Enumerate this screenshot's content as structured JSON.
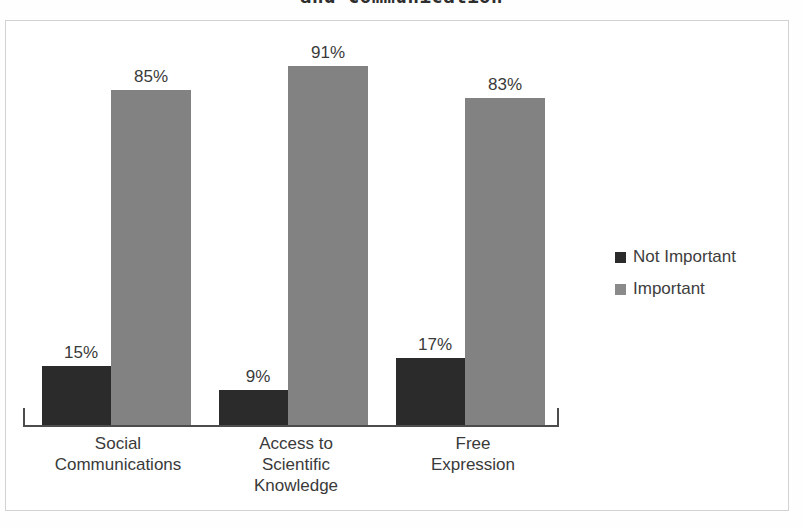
{
  "chart_data": {
    "type": "bar",
    "title": "and Communication",
    "title_note": "Title is clipped at the top edge of the screenshot; only the second line is visible.",
    "xlabel": "",
    "ylabel": "",
    "ylim": [
      0,
      100
    ],
    "grid": false,
    "legend_position": "right",
    "orientation": "vertical",
    "grouping": "clustered",
    "categories": [
      "Social Communications",
      "Access to Scientific Knowledge",
      "Free Expression"
    ],
    "category_lines": [
      [
        "Social",
        "Communications"
      ],
      [
        "Access to",
        "Scientific",
        "Knowledge"
      ],
      [
        "Free",
        "Expression"
      ]
    ],
    "series": [
      {
        "name": "Not Important",
        "color": "#2b2b2b",
        "values": [
          15,
          9,
          17
        ],
        "labels": [
          "15%",
          "9%",
          "17%"
        ]
      },
      {
        "name": "Important",
        "color": "#828282",
        "values": [
          85,
          91,
          83
        ],
        "labels": [
          "85%",
          "91%",
          "83%"
        ]
      }
    ],
    "axis": {
      "has_left_tick": true,
      "has_right_tick": true,
      "baseline_color": "#4c4c4c",
      "tick_labels": []
    }
  },
  "legend": {
    "items": [
      {
        "label": "Not Important",
        "swatch": "dark-square-icon"
      },
      {
        "label": "Important",
        "swatch": "gray-square-icon"
      }
    ]
  },
  "bars": [
    {
      "group": 0,
      "series": 0,
      "label": "15%",
      "value": 15,
      "left": 19,
      "width": 78,
      "tone": "dark"
    },
    {
      "group": 0,
      "series": 1,
      "label": "85%",
      "value": 85,
      "left": 88,
      "width": 80,
      "tone": "light"
    },
    {
      "group": 1,
      "series": 0,
      "label": "9%",
      "value": 9,
      "left": 196,
      "width": 78,
      "tone": "dark"
    },
    {
      "group": 1,
      "series": 1,
      "label": "91%",
      "value": 91,
      "left": 265,
      "width": 80,
      "tone": "light"
    },
    {
      "group": 2,
      "series": 0,
      "label": "17%",
      "value": 17,
      "left": 373,
      "width": 78,
      "tone": "dark"
    },
    {
      "group": 2,
      "series": 1,
      "label": "83%",
      "value": 83,
      "left": 442,
      "width": 80,
      "tone": "light"
    }
  ]
}
